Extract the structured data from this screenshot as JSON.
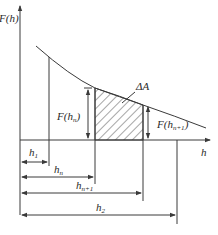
{
  "diagram": {
    "y_axis_label": "F(h)",
    "x_axis_label": "h",
    "area_label": "ΔA",
    "f_hn_label": "F(h",
    "f_hn_sub": "n",
    "f_hn1_label": "F(h",
    "f_hn1_sub": "n+1",
    "close_paren": ")",
    "dims": {
      "h1": {
        "base": "h",
        "sub": "1"
      },
      "hn": {
        "base": "h",
        "sub": "n"
      },
      "hn1": {
        "base": "h",
        "sub": "n+1"
      },
      "h2": {
        "base": "h",
        "sub": "2"
      }
    },
    "colors": {
      "line": "#3a3a3a",
      "hatch": "#3a3a3a",
      "background": "#ffffff"
    }
  }
}
